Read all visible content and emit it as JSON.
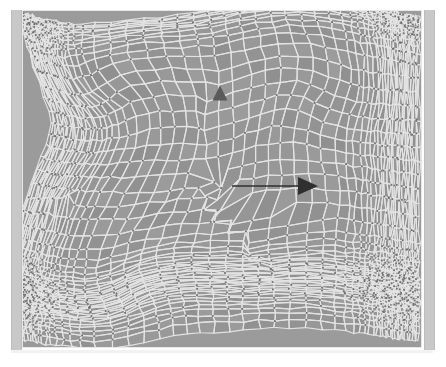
{
  "view": {
    "title": "Adaptive unstructured quadrilateral mesh",
    "background_color": "#ffffff",
    "canvas_color": "#9b9b9b",
    "cell_fill_color": "#9b9b9b",
    "cell_edge_color": "#e3e3e3",
    "vertex_color": "#6f6f6f",
    "frame_bar_color": "#c8c8c8",
    "frame_border_color": "#e8e8e8"
  },
  "mesh": {
    "type": "unstructured-quadrilateral",
    "shading": "grayscale",
    "cell_count_approx": 4200,
    "region_note_upper_left": "dense highly-anisotropic stretched cells",
    "region_note_lower_left": "coarse large quadrilateral cells",
    "region_note_right": "regular near-orthogonal grid cells",
    "region_note_center": "swirl / vortex refinement band"
  },
  "annotations": {
    "triangle_marker": {
      "name": "triangle-marker",
      "shape": "triangle-up",
      "color": "#5a5a5a",
      "x": 220,
      "y": 93,
      "size": 15
    },
    "arrow": {
      "name": "direction-arrow",
      "shape": "arrow-right",
      "color": "#2f2f2f",
      "x_start": 232,
      "x_end": 318,
      "y": 186,
      "head_length": 20,
      "head_width": 18
    }
  },
  "frame": {
    "left_bar_label": "left-frame-bar",
    "right_bar_label": "right-frame-bar",
    "bottom_strip_label": "bottom-frame-strip"
  }
}
